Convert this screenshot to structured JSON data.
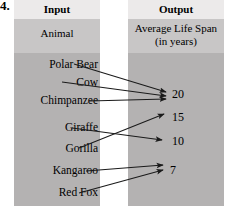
{
  "exercise": {
    "number": "4."
  },
  "columns": {
    "input": {
      "header": "Input",
      "subheader": "Animal"
    },
    "output": {
      "header": "Output",
      "subheader_line1": "Average Life Span",
      "subheader_line2": "(in years)"
    }
  },
  "inputs": [
    {
      "label": "Polar Bear",
      "y": 68,
      "text_x": 98
    },
    {
      "label": "Cow",
      "y": 86,
      "text_x": 98
    },
    {
      "label": "Chimpanzee",
      "y": 104,
      "text_x": 98
    },
    {
      "label": "Giraffe",
      "y": 131,
      "text_x": 98
    },
    {
      "label": "Gorilla",
      "y": 152,
      "text_x": 98
    },
    {
      "label": "Kangaroo",
      "y": 174,
      "text_x": 98
    },
    {
      "label": "Red Fox",
      "y": 196,
      "text_x": 98
    }
  ],
  "outputs": [
    {
      "label": "20",
      "y": 97,
      "text_x": 172
    },
    {
      "label": "15",
      "y": 120,
      "text_x": 172
    },
    {
      "label": "10",
      "y": 144,
      "text_x": 172
    },
    {
      "label": "7",
      "y": 173,
      "text_x": 170
    }
  ],
  "mappings": [
    {
      "from": "Polar Bear",
      "to": "20",
      "x1": 74,
      "y1": 64,
      "x2": 166,
      "y2": 92
    },
    {
      "from": "Cow",
      "to": "20",
      "x1": 62,
      "y1": 82,
      "x2": 166,
      "y2": 96
    },
    {
      "from": "Chimpanzee",
      "to": "20",
      "x1": 89,
      "y1": 101,
      "x2": 166,
      "y2": 99
    },
    {
      "from": "Gorilla",
      "to": "15",
      "x1": 79,
      "y1": 148,
      "x2": 164,
      "y2": 114
    },
    {
      "from": "Giraffe",
      "to": "10",
      "x1": 72,
      "y1": 128,
      "x2": 162,
      "y2": 140
    },
    {
      "from": "Kangaroo",
      "to": "7",
      "x1": 86,
      "y1": 171,
      "x2": 163,
      "y2": 165
    },
    {
      "from": "Red Fox",
      "to": "7",
      "x1": 79,
      "y1": 193,
      "x2": 163,
      "y2": 170
    }
  ],
  "colors": {
    "header_band": "#eceaea",
    "subheader_band": "#c8c6c6",
    "body_band": "#b4b2b2",
    "line": "#1a1a1a",
    "text": "#000000",
    "page_background": "#ffffff"
  }
}
